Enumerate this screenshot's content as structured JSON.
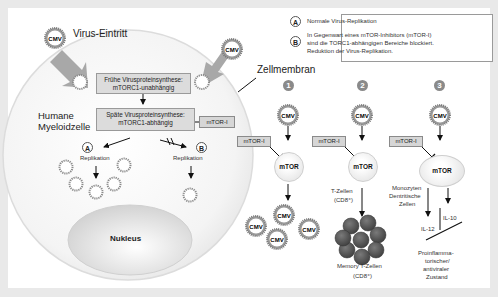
{
  "diagram": {
    "title_virus_entry": "Virus-Eintritt",
    "cell_membrane_label": "Zellmembran",
    "cell_label_line1": "Humane",
    "cell_label_line2": "Myeloidzelle",
    "early_synthesis": {
      "line1": "Frühe Virusproteinsynthese:",
      "line2": "mTORC1-unabhängig"
    },
    "late_synthesis": {
      "line1": "Späte Virusproteinsynthese:",
      "line2": "mTORC1-abhängig"
    },
    "inhibitor_label": "mTOR-I",
    "path_a": {
      "letter": "A",
      "label": "Replikation"
    },
    "path_b": {
      "letter": "B",
      "label": "Replikation"
    },
    "nucleus_label": "Nukleus",
    "virus_label": "CMV"
  },
  "legend": {
    "a": {
      "letter": "A",
      "text": "Normale Virus-Replikation"
    },
    "b": {
      "letter": "B",
      "line1": "In Gegenwart eines mTOR-Inhibitors (mTOR-I)",
      "line2": "sind die TORC1-abhängigen Bereiche blockiert.",
      "line3": "Reduktion der Virus-Replikation."
    }
  },
  "panels": [
    {
      "number": "1",
      "virus": "CMV",
      "inhibitor": "mTOR-I",
      "target": "mTOR"
    },
    {
      "number": "2",
      "virus": "CMV",
      "inhibitor": "mTOR-I",
      "target": "mTOR",
      "cells_line1": "T-Zellen",
      "cells_line2": "(CD8⁺)",
      "result_line1": "Memory T-Zellen",
      "result_line2": "(CD8⁺)"
    },
    {
      "number": "3",
      "virus": "CMV",
      "inhibitor": "mTOR-I",
      "target": "mTOR",
      "cells_line1": "Monozyten",
      "cells_line2": "Dentritische",
      "cells_line3": "Zellen",
      "il12": "IL-12",
      "il10": "IL-10",
      "result_line1": "Proinflamma-",
      "result_line2": "torischer/",
      "result_line3": "antiviraler",
      "result_line4": "Zustand"
    }
  ],
  "colors": {
    "background": "#e9e9e9",
    "panel": "#ffffff",
    "box": "#dcdcdc",
    "cell_dark": "#555555",
    "arrow_gray": "#9a9a9a"
  }
}
